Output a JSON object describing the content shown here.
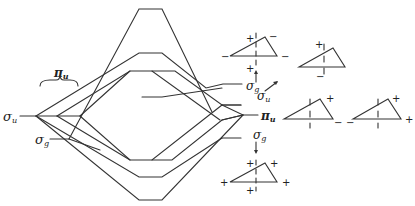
{
  "diagram": {
    "type": "molecular orbital correlation diagram",
    "left_labels": {
      "sigma_u": {
        "symbol": "σ",
        "subscript": "u"
      },
      "pi_u": {
        "symbol": "π",
        "subscript": "u"
      },
      "sigma_g": {
        "symbol": "σ",
        "subscript": "g"
      }
    },
    "right_labels": {
      "sigma_g_top": {
        "symbol": "σ",
        "subscript": "g"
      },
      "sigma_u": {
        "symbol": "σ",
        "subscript": "u"
      },
      "pi_u": {
        "symbol": "π",
        "subscript": "u"
      },
      "sigma_g_bottom": {
        "symbol": "σ",
        "subscript": "g"
      }
    },
    "orbital_sketches": [
      {
        "name": "sigma-g-top-sketch",
        "signs": [
          "+",
          "−",
          "−",
          "−",
          "+"
        ]
      },
      {
        "name": "sigma-u-sketch",
        "signs": [
          "+",
          "−"
        ]
      },
      {
        "name": "pi-u-sketch-1",
        "signs": [
          "+",
          "−"
        ]
      },
      {
        "name": "pi-u-sketch-2",
        "signs": [
          "+",
          "−",
          "+"
        ]
      },
      {
        "name": "sigma-g-bottom-sketch",
        "signs": [
          "+",
          "+",
          "+",
          "+",
          "+"
        ]
      }
    ],
    "signs": {
      "plus": "+",
      "minus": "−"
    }
  }
}
